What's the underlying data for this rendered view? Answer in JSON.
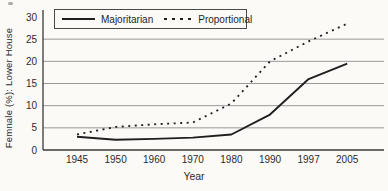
{
  "chart_data": {
    "type": "line",
    "title": "",
    "xlabel": "Year",
    "ylabel": "Femnale (%): Lower House",
    "x_tick_labels": [
      "1945",
      "1950",
      "1960",
      "1970",
      "1980",
      "1990",
      "1997",
      "2005"
    ],
    "y_ticks": [
      0,
      5,
      10,
      15,
      20,
      25,
      30
    ],
    "ylim": [
      0,
      30
    ],
    "grid": "horizontal-only",
    "legend_position": "top-inside-boxed",
    "series": [
      {
        "name": "Majoritarian",
        "style": "solid",
        "values": [
          3,
          2.3,
          2.5,
          2.8,
          3.5,
          8,
          16,
          19.5
        ]
      },
      {
        "name": "Proportional",
        "style": "dotted",
        "values": [
          3.5,
          5.2,
          5.8,
          6.2,
          10.5,
          20,
          24.5,
          28.5
        ]
      }
    ],
    "colors": {
      "line": "#1f1f1f",
      "grid": "#8e8e8e",
      "axis": "#3a3a3a",
      "text": "#2b2b2b",
      "background": "#fbfaf7"
    }
  }
}
